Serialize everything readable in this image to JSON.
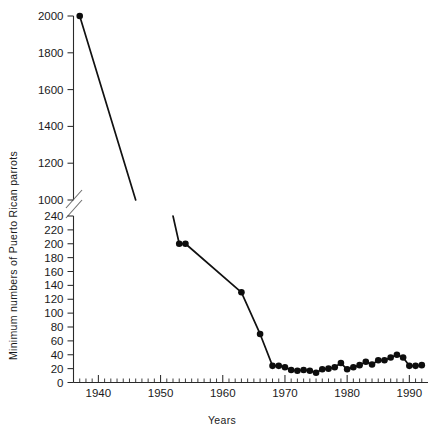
{
  "chart_data": {
    "type": "line",
    "title": "",
    "xlabel": "Years",
    "ylabel": "Minimum numbers of Puerto Rican parrots",
    "xlim": [
      1936,
      1993
    ],
    "x_ticks_major": [
      1940,
      1950,
      1960,
      1970,
      1980,
      1990
    ],
    "x_tick_labels": [
      "1940",
      "1950",
      "1960",
      "1970",
      "1980",
      "1990"
    ],
    "x_minor_tick_step": 1,
    "grid": false,
    "legend": null,
    "broken_axis": true,
    "axis_break_note": "y-axis broken between 240 and 1000",
    "y_upper": {
      "ticks": [
        1000,
        1200,
        1400,
        1600,
        1800,
        2000
      ],
      "tick_labels": [
        "1000",
        "1200",
        "1400",
        "1600",
        "1800",
        "2000"
      ],
      "ylim": [
        1000,
        2000
      ]
    },
    "y_lower": {
      "ticks": [
        0,
        20,
        40,
        60,
        80,
        100,
        120,
        140,
        160,
        180,
        200,
        220,
        240
      ],
      "tick_labels": [
        "0",
        "20",
        "40",
        "60",
        "80",
        "100",
        "120",
        "140",
        "160",
        "180",
        "200",
        "220",
        "240"
      ],
      "ylim": [
        0,
        240
      ]
    },
    "series": [
      {
        "name": "Minimum numbers of Puerto Rican parrots",
        "segment": "upper",
        "marker": "circle",
        "points": [
          {
            "x": 1937,
            "y": 2000,
            "marker": true
          },
          {
            "x": 1946,
            "y": 1000,
            "marker": false
          }
        ]
      },
      {
        "name": "Minimum numbers of Puerto Rican parrots",
        "segment": "lower",
        "marker": "circle",
        "points": [
          {
            "x": 1952,
            "y": 240,
            "marker": false
          },
          {
            "x": 1953,
            "y": 200,
            "marker": true
          },
          {
            "x": 1954,
            "y": 200,
            "marker": true
          },
          {
            "x": 1963,
            "y": 130,
            "marker": true
          },
          {
            "x": 1966,
            "y": 70,
            "marker": true
          },
          {
            "x": 1968,
            "y": 24,
            "marker": true
          },
          {
            "x": 1969,
            "y": 24,
            "marker": true
          },
          {
            "x": 1970,
            "y": 22,
            "marker": true
          },
          {
            "x": 1971,
            "y": 18,
            "marker": true
          },
          {
            "x": 1972,
            "y": 17,
            "marker": true
          },
          {
            "x": 1973,
            "y": 18,
            "marker": true
          },
          {
            "x": 1974,
            "y": 17,
            "marker": true
          },
          {
            "x": 1975,
            "y": 14,
            "marker": true
          },
          {
            "x": 1976,
            "y": 19,
            "marker": true
          },
          {
            "x": 1977,
            "y": 20,
            "marker": true
          },
          {
            "x": 1978,
            "y": 22,
            "marker": true
          },
          {
            "x": 1979,
            "y": 28,
            "marker": true
          },
          {
            "x": 1980,
            "y": 19,
            "marker": true
          },
          {
            "x": 1981,
            "y": 22,
            "marker": true
          },
          {
            "x": 1982,
            "y": 25,
            "marker": true
          },
          {
            "x": 1983,
            "y": 30,
            "marker": true
          },
          {
            "x": 1984,
            "y": 26,
            "marker": true
          },
          {
            "x": 1985,
            "y": 32,
            "marker": true
          },
          {
            "x": 1986,
            "y": 32,
            "marker": true
          },
          {
            "x": 1987,
            "y": 36,
            "marker": true
          },
          {
            "x": 1988,
            "y": 40,
            "marker": true
          },
          {
            "x": 1989,
            "y": 36,
            "marker": true
          },
          {
            "x": 1990,
            "y": 24,
            "marker": true
          },
          {
            "x": 1991,
            "y": 24,
            "marker": true
          },
          {
            "x": 1992,
            "y": 25,
            "marker": true
          }
        ]
      }
    ]
  },
  "colors": {
    "line": "#111111",
    "marker": "#0d0d0d",
    "axis": "#2a2a2a",
    "text": "#1a1a1a",
    "background": "#ffffff"
  }
}
